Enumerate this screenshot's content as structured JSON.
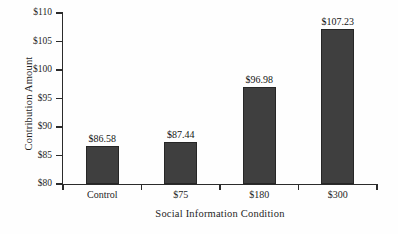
{
  "chart_data": {
    "type": "bar",
    "title": "",
    "xlabel": "Social Information Condition",
    "ylabel": "Contribution Amount",
    "categories": [
      "Control",
      "$75",
      "$180",
      "$300"
    ],
    "values": [
      86.58,
      87.44,
      96.98,
      107.23
    ],
    "data_labels": [
      "$86.58",
      "$87.44",
      "$96.98",
      "$107.23"
    ],
    "ylim": [
      80,
      110
    ],
    "yticks": [
      80,
      85,
      90,
      95,
      100,
      105,
      110
    ],
    "ytick_labels": [
      "$80",
      "$85",
      "$90",
      "$95",
      "$100",
      "$105",
      "$110"
    ],
    "grid": false,
    "legend": null,
    "colors": {
      "bar_fill": "#3f3f3f",
      "bar_edge": "#262626",
      "axis": "#2b2b2b",
      "text": "#1f1f1f",
      "background": "#fefefe"
    }
  }
}
